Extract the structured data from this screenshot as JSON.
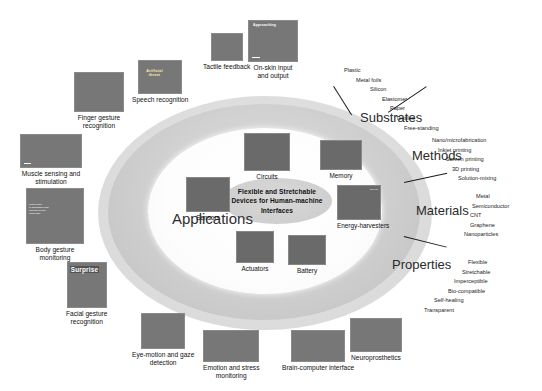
{
  "figure": {
    "center_title": "Flexible and Stretchable Devices for Human-machine Interfaces",
    "applications_label": "Applications"
  },
  "categories": [
    {
      "id": "substrates",
      "label": "Substrates",
      "items": [
        "Plastic",
        "Metal foils",
        "Silicon",
        "Elastomer",
        "Paper",
        "Textiles",
        "Free-standing"
      ]
    },
    {
      "id": "methods",
      "label": "Methods",
      "items": [
        "Nano/microfabrication",
        "Inkjet printing",
        "Screen printing",
        "3D printing",
        "Solution-mixing"
      ]
    },
    {
      "id": "materials",
      "label": "Materials",
      "items": [
        "Metal",
        "Semiconductor",
        "CNT",
        "Graphene",
        "Nanoparticles"
      ]
    },
    {
      "id": "properties",
      "label": "Properties",
      "items": [
        "Flexible",
        "Stretchable",
        "Imperceptible",
        "Bio-compatible",
        "Self-healing",
        "Transparent"
      ]
    }
  ],
  "devices": [
    {
      "id": "circuits",
      "label": "Circuits"
    },
    {
      "id": "memory",
      "label": "Memory"
    },
    {
      "id": "sensors",
      "label": "Sensors"
    },
    {
      "id": "energy-harvesters",
      "label": "Energy-harvesters"
    },
    {
      "id": "actuators",
      "label": "Actuators"
    },
    {
      "id": "battery",
      "label": "Battery"
    }
  ],
  "applications": [
    {
      "id": "finger-gesture-recognition",
      "label": "Finger gesture\nrecognition"
    },
    {
      "id": "speech-recognition",
      "label": "Speech recognition"
    },
    {
      "id": "tactile-feedback",
      "label": "Tactile feedback"
    },
    {
      "id": "on-skin-input-and-output",
      "label": "On-skin input\nand output"
    },
    {
      "id": "muscle-sensing-and-stimulation",
      "label": "Muscle sensing and\nstimulation"
    },
    {
      "id": "body-gesture-monitoring",
      "label": "Body gesture\nmonitoring"
    },
    {
      "id": "facial-gesture-recognition",
      "label": "Facial gesture\nrecognition"
    },
    {
      "id": "eye-motion-and-gaze-detection",
      "label": "Eye-motion and gaze\ndetection"
    },
    {
      "id": "emotion-and-stress-monitoring",
      "label": "Emotion and stress\nmonitoring"
    },
    {
      "id": "brain-computer-interface",
      "label": "Brain-computer interface"
    },
    {
      "id": "neuroprosthetics",
      "label": "Neuroprosthetics"
    }
  ],
  "image_overlays": {
    "surprise_tag": "Surprise",
    "artificial_throat_tag": "Artificial\nthroat",
    "approaching_tag": "Approaching",
    "body_note": "control data\nto acquisition node\ncollected on the\nchest data",
    "energy_scale": "500 nm"
  },
  "colors": {
    "outer_ring": "#d2d2d2",
    "inner_ring": "#ffffff",
    "center_ellipse": "#cfcfcf",
    "text": "#111111",
    "background": "#ffffff"
  }
}
